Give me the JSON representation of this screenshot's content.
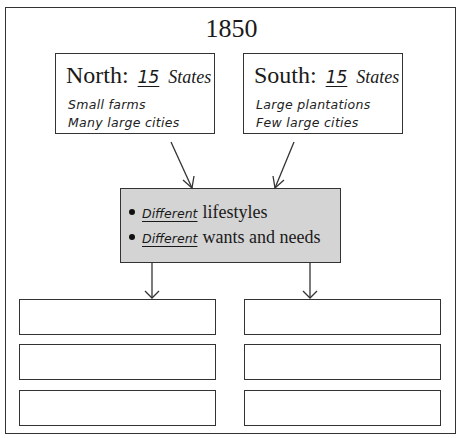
{
  "title": "1850",
  "north": {
    "label": "North:",
    "count": "15",
    "unit": "States",
    "notes": [
      "Small farms",
      "Many large cities"
    ]
  },
  "south": {
    "label": "South:",
    "count": "15",
    "unit": "States",
    "notes": [
      "Large plantations",
      "Few large cities"
    ]
  },
  "center": {
    "items": [
      {
        "handwritten": "Different",
        "text": "lifestyles"
      },
      {
        "handwritten": "Different",
        "text": "wants and needs"
      }
    ],
    "background": "#d4d4d4"
  },
  "outcomes": {
    "left": [
      "",
      "",
      ""
    ],
    "right": [
      "",
      "",
      ""
    ]
  }
}
